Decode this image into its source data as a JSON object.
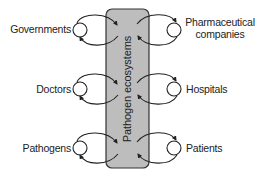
{
  "diagram": {
    "center": {
      "label": "Pathogen ecosystems",
      "fill": "#bdbdbd",
      "stroke": "#333333"
    },
    "left_nodes": [
      {
        "label": "Governments"
      },
      {
        "label": "Doctors"
      },
      {
        "label": "Pathogens"
      }
    ],
    "right_nodes": [
      {
        "label": "Pharmaceutical companies",
        "line1": "Pharmaceutical",
        "line2": "companies"
      },
      {
        "label": "Hospitals"
      },
      {
        "label": "Patients"
      }
    ],
    "colors": {
      "line": "#222222",
      "text": "#222222"
    }
  }
}
